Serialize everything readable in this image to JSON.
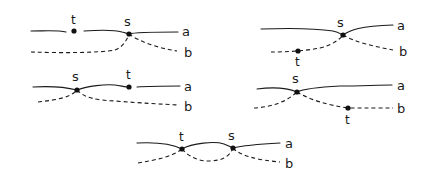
{
  "figure": {
    "line_labels": {
      "a": "a",
      "b": "b"
    },
    "point_labels": {
      "s": "s",
      "t": "t"
    },
    "panels": [
      {
        "id": "top-left",
        "t_on": "a",
        "t_position": "left of s"
      },
      {
        "id": "top-right",
        "t_on": "b",
        "t_position": "left of s"
      },
      {
        "id": "middle-left",
        "t_on": "a",
        "t_position": "right of s"
      },
      {
        "id": "middle-right",
        "t_on": "b",
        "t_position": "right of s"
      },
      {
        "id": "bottom-center",
        "t_on": "a and b (second crossing)",
        "t_position": "left of s"
      }
    ]
  },
  "colors": {
    "ink": "#1a1a1a",
    "background": "#ffffff"
  }
}
